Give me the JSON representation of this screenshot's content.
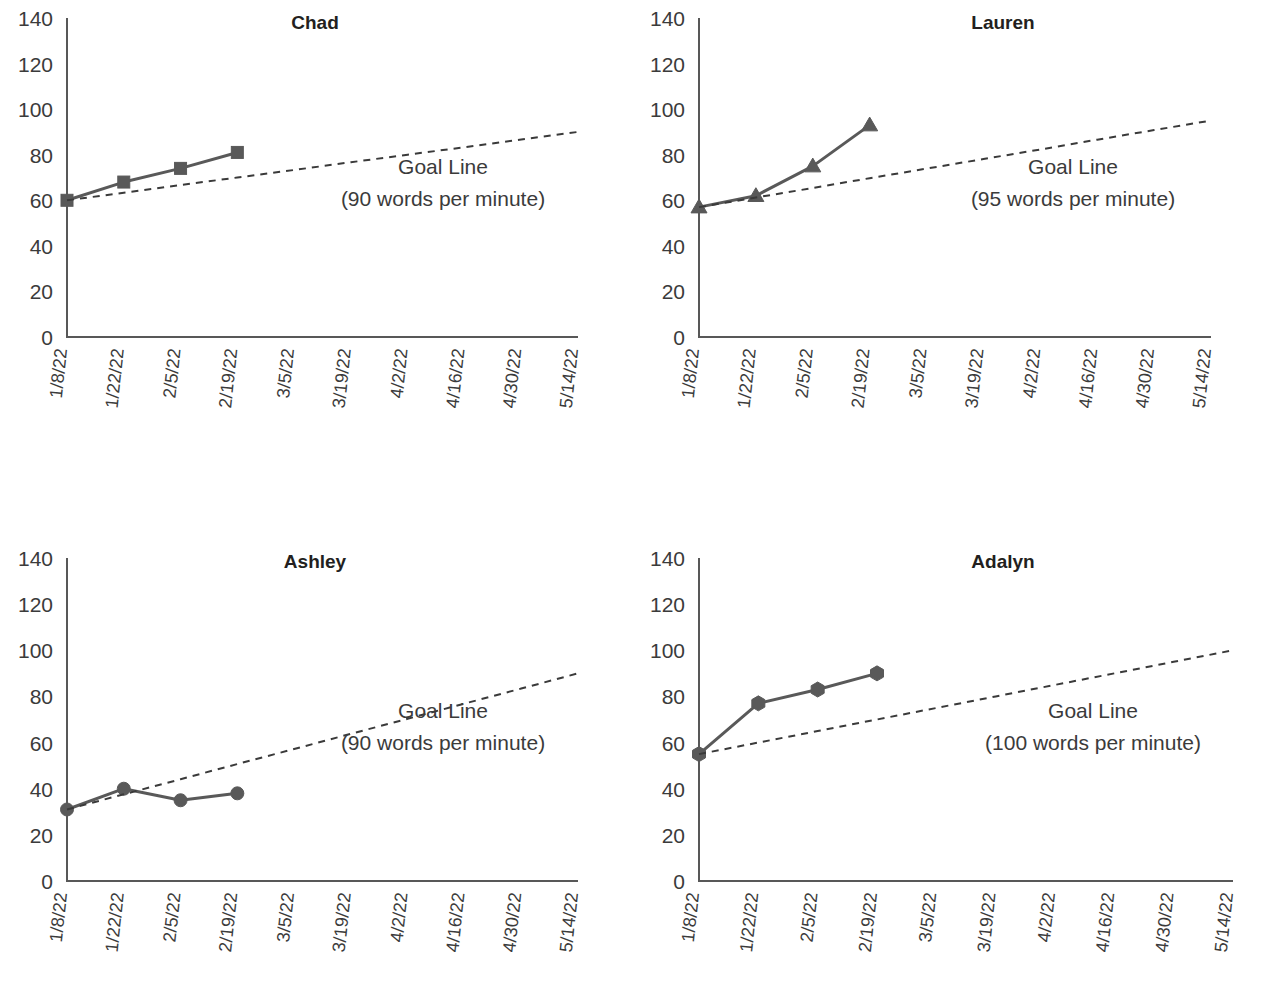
{
  "page": {
    "kind": "small-multiples-progress-monitoring",
    "panel_order": [
      "chad",
      "lauren",
      "ashley",
      "adalyn"
    ]
  },
  "axis": {
    "y_ticks": [
      "0",
      "20",
      "40",
      "60",
      "80",
      "100",
      "120",
      "140"
    ],
    "y_min": 0,
    "y_max": 140,
    "x_ticks": [
      "1/8/22",
      "1/22/22",
      "2/5/22",
      "2/19/22",
      "3/5/22",
      "3/19/22",
      "4/2/22",
      "4/16/22",
      "4/30/22",
      "5/14/22"
    ]
  },
  "colors": {
    "series": "#595959",
    "goal": "#3a3a3a",
    "axis": "#585858",
    "text": "#3b3b3b",
    "title": "#231f20",
    "background": "#ffffff"
  },
  "panels": {
    "chad": {
      "title": "Chad",
      "goal_label_line1": "Goal Line",
      "goal_label_line2": "(90 words per minute)",
      "marker": "square"
    },
    "lauren": {
      "title": "Lauren",
      "goal_label_line1": "Goal Line",
      "goal_label_line2": "(95 words per minute)",
      "marker": "triangle"
    },
    "ashley": {
      "title": "Ashley",
      "goal_label_line1": "Goal Line",
      "goal_label_line2": "(90 words per minute)",
      "marker": "circle"
    },
    "adalyn": {
      "title": "Adalyn",
      "goal_label_line1": "Goal Line",
      "goal_label_line2": "(100 words per minute)",
      "marker": "hexagon"
    }
  },
  "chart_data": [
    {
      "type": "line",
      "id": "chad",
      "title": "Chad",
      "xlabel": "",
      "ylabel": "",
      "ylim": [
        0,
        140
      ],
      "grid": false,
      "legend": "none",
      "x": [
        "1/8/22",
        "1/22/22",
        "2/5/22",
        "2/19/22",
        "3/5/22",
        "3/19/22",
        "4/2/22",
        "4/16/22",
        "4/30/22",
        "5/14/22"
      ],
      "series": [
        {
          "name": "Words per minute",
          "marker": "square",
          "values": [
            60,
            68,
            74,
            81,
            null,
            null,
            null,
            null,
            null,
            null
          ]
        },
        {
          "name": "Goal Line",
          "style": "dashed",
          "annotation": "Goal Line (90 words per minute)",
          "values": [
            60,
            63.3,
            66.7,
            70,
            73.3,
            76.7,
            80,
            83.3,
            86.7,
            90
          ]
        }
      ]
    },
    {
      "type": "line",
      "id": "lauren",
      "title": "Lauren",
      "xlabel": "",
      "ylabel": "",
      "ylim": [
        0,
        140
      ],
      "grid": false,
      "legend": "none",
      "x": [
        "1/8/22",
        "1/22/22",
        "2/5/22",
        "2/19/22",
        "3/5/22",
        "3/19/22",
        "4/2/22",
        "4/16/22",
        "4/30/22",
        "5/14/22"
      ],
      "series": [
        {
          "name": "Words per minute",
          "marker": "triangle",
          "values": [
            57,
            62,
            75,
            93,
            null,
            null,
            null,
            null,
            null,
            null
          ]
        },
        {
          "name": "Goal Line",
          "style": "dashed",
          "annotation": "Goal Line (95 words per minute)",
          "values": [
            57,
            61.2,
            65.4,
            69.7,
            73.9,
            78.1,
            82.3,
            86.6,
            90.8,
            95
          ]
        }
      ]
    },
    {
      "type": "line",
      "id": "ashley",
      "title": "Ashley",
      "xlabel": "",
      "ylabel": "",
      "ylim": [
        0,
        140
      ],
      "grid": false,
      "legend": "none",
      "x": [
        "1/8/22",
        "1/22/22",
        "2/5/22",
        "2/19/22",
        "3/5/22",
        "3/19/22",
        "4/2/22",
        "4/16/22",
        "4/30/22",
        "5/14/22"
      ],
      "series": [
        {
          "name": "Words per minute",
          "marker": "circle",
          "values": [
            31,
            40,
            35,
            38,
            null,
            null,
            null,
            null,
            null,
            null
          ]
        },
        {
          "name": "Goal Line",
          "style": "dashed",
          "annotation": "Goal Line (90 words per minute)",
          "values": [
            31,
            37.6,
            44.1,
            50.7,
            57.2,
            63.8,
            70.3,
            76.9,
            83.4,
            90
          ]
        }
      ]
    },
    {
      "type": "line",
      "id": "adalyn",
      "title": "Adalyn",
      "xlabel": "",
      "ylabel": "",
      "ylim": [
        0,
        140
      ],
      "grid": false,
      "legend": "none",
      "x": [
        "1/8/22",
        "1/22/22",
        "2/5/22",
        "2/19/22",
        "3/5/22",
        "3/19/22",
        "4/2/22",
        "4/16/22",
        "4/30/22",
        "5/14/22"
      ],
      "series": [
        {
          "name": "Words per minute",
          "marker": "hexagon",
          "values": [
            55,
            77,
            83,
            90,
            null,
            null,
            null,
            null,
            null,
            null
          ]
        },
        {
          "name": "Goal Line",
          "style": "dashed",
          "annotation": "Goal Line (100 words per minute)",
          "values": [
            55,
            60,
            65,
            70,
            75,
            80,
            85,
            90,
            95,
            100
          ]
        }
      ]
    }
  ]
}
